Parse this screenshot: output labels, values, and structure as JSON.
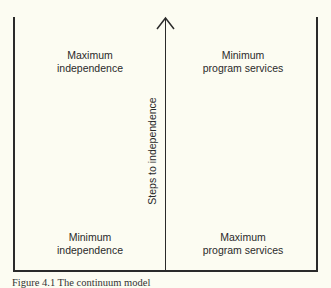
{
  "diagram": {
    "vertical_axis_label": "Steps to independence",
    "quadrants": {
      "top_left": {
        "line1": "Maximum",
        "line2": "independence"
      },
      "top_right": {
        "line1": "Minimum",
        "line2": "program services"
      },
      "bottom_left": {
        "line1": "Minimum",
        "line2": "independence"
      },
      "bottom_right": {
        "line1": "Maximum",
        "line2": "program services"
      }
    },
    "caption": "Figure 4.1   The continuum model"
  },
  "colors": {
    "background": "#fcfcf2",
    "ink": "#2a2a2a"
  }
}
